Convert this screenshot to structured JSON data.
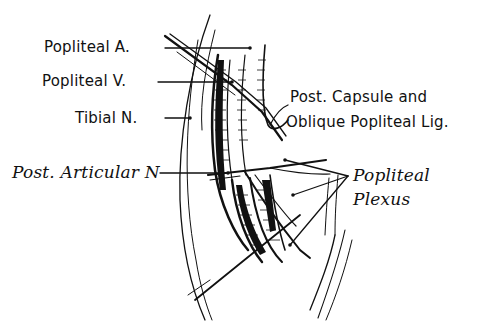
{
  "diagram": {
    "colors": {
      "ink": "#111111",
      "background": "#ffffff"
    },
    "labels": [
      {
        "id": "popliteal-artery",
        "text": "Popliteal A."
      },
      {
        "id": "popliteal-vein",
        "text": "Popliteal V."
      },
      {
        "id": "tibial-nerve",
        "text": "Tibial N."
      },
      {
        "id": "post-capsule-line1",
        "text": "Post. Capsule and"
      },
      {
        "id": "post-capsule-line2",
        "text": "Oblique Popliteal Lig."
      },
      {
        "id": "post-articular-nerve",
        "text": "Post. Articular N"
      },
      {
        "id": "popliteal-plexus-line1",
        "text": "Popliteal"
      },
      {
        "id": "popliteal-plexus-line2",
        "text": "Plexus"
      }
    ]
  }
}
